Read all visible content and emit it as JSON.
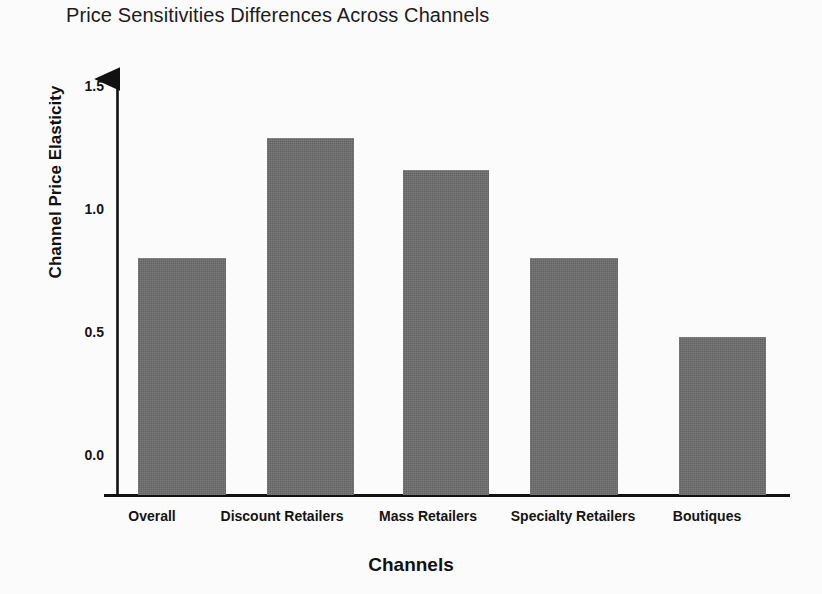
{
  "chart_data": {
    "type": "bar",
    "title": "Price Sensitivities Differences Across Channels",
    "xlabel": "Channels",
    "ylabel": "Channel Price Elasticity",
    "categories": [
      "Overall",
      "Discount Retailers",
      "Mass Retailers",
      "Specialty Retailers",
      "Boutiques"
    ],
    "values": [
      0.8,
      1.29,
      1.16,
      0.8,
      0.48
    ],
    "ylim": [
      0.0,
      1.5
    ],
    "ytick_labels": [
      "1.5",
      "1.0",
      "0.5",
      "0.0"
    ],
    "ytick_values": [
      1.5,
      1.0,
      0.5,
      0.0
    ],
    "grid": false,
    "legend": null,
    "bar_color": "#6b6b6b",
    "axis_color": "#111111",
    "background_color": "#fbfbfb"
  }
}
